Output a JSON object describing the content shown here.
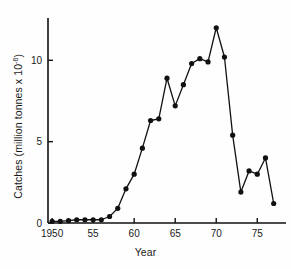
{
  "chart_data": {
    "type": "line",
    "title": "",
    "xlabel": "Year",
    "ylabel_prefix": "Catches (million tonnes x 10",
    "ylabel_exponent": "-6",
    "ylabel_suffix": ")",
    "ylabel_full": "Catches (million tonnes x 10-6)",
    "x": [
      1950,
      1951,
      1952,
      1953,
      1954,
      1955,
      1956,
      1957,
      1958,
      1959,
      1960,
      1961,
      1962,
      1963,
      1964,
      1965,
      1966,
      1967,
      1968,
      1969,
      1970,
      1971,
      1972,
      1973,
      1974,
      1975,
      1976,
      1977
    ],
    "values": [
      0.1,
      0.1,
      0.15,
      0.2,
      0.2,
      0.2,
      0.2,
      0.4,
      0.9,
      2.1,
      3.0,
      4.6,
      6.3,
      6.4,
      8.9,
      7.2,
      8.5,
      9.8,
      10.1,
      9.9,
      12.0,
      10.2,
      5.4,
      1.9,
      3.2,
      3.0,
      4.0,
      1.2
    ],
    "xlim": [
      1949.5,
      1978.5
    ],
    "ylim": [
      0,
      12.6
    ],
    "xticks": [
      1950,
      1955,
      1960,
      1965,
      1970,
      1975
    ],
    "xticklabels": [
      "1950",
      "55",
      "60",
      "65",
      "70",
      "75"
    ],
    "yticks": [
      0,
      5,
      10
    ],
    "yticklabels": [
      "0",
      "5",
      "10"
    ],
    "grid": false,
    "legend": false,
    "marker": "filled-circle",
    "line_color": "#111111",
    "marker_color": "#111111"
  }
}
